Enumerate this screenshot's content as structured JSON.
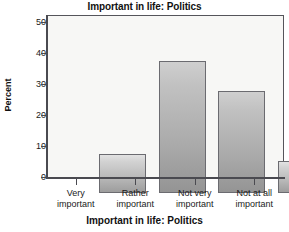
{
  "chart_data": {
    "type": "bar",
    "title": "Important in life: Politics",
    "xlabel": "Important in life: Politics",
    "ylabel": "Percent",
    "categories": [
      "Very important",
      "Rather important",
      "Not very important",
      "Not at all important"
    ],
    "category_lines": [
      [
        "Very",
        "important"
      ],
      [
        "Rather",
        "important"
      ],
      [
        "Not very",
        "important"
      ],
      [
        "Not at all",
        "important"
      ]
    ],
    "values": [
      12.5,
      42.5,
      33.0,
      10.5
    ],
    "ylim": [
      0,
      52
    ],
    "yticks": [
      0,
      10,
      20,
      30,
      40,
      50
    ],
    "ytick_labels": [
      "0",
      "10",
      "20",
      "30",
      "40",
      "50"
    ],
    "grid": false,
    "legend": "none",
    "colors": {
      "bar_light_top": "#e2e2e2",
      "bar_light_bottom": "#9d9d9d",
      "bar_dark_top": "#cfcfcf",
      "bar_dark_bottom": "#949494",
      "bar_border": "#6b6b70",
      "axis": "#4a4a50",
      "plot_background": "#f7f7f5",
      "text": "#111111"
    },
    "bar_shades": [
      "light",
      "dark",
      "dark",
      "light"
    ]
  }
}
